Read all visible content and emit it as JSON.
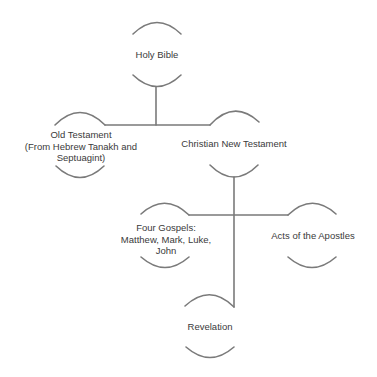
{
  "diagram": {
    "type": "tree",
    "line_color": "#7a7a7a",
    "text_color": "#3a3a3a",
    "nodes": {
      "root": {
        "label": "Holy Bible"
      },
      "old_testament": {
        "lines": [
          "Old Testament",
          "(From Hebrew Tanakh and",
          "Septuagint)"
        ]
      },
      "new_testament": {
        "label": "Christian New Testament"
      },
      "gospels": {
        "lines": [
          "Four Gospels:",
          "Matthew, Mark, Luke,",
          "John"
        ]
      },
      "acts": {
        "label": "Acts of the Apostles"
      },
      "revelation": {
        "label": "Revelation"
      }
    },
    "edges": [
      [
        "Holy Bible",
        "Old Testament (From Hebrew Tanakh and Septuagint)"
      ],
      [
        "Holy Bible",
        "Christian New Testament"
      ],
      [
        "Christian New Testament",
        "Four Gospels: Matthew, Mark, Luke, John"
      ],
      [
        "Christian New Testament",
        "Acts of the Apostles"
      ],
      [
        "Christian New Testament",
        "Revelation"
      ]
    ]
  }
}
